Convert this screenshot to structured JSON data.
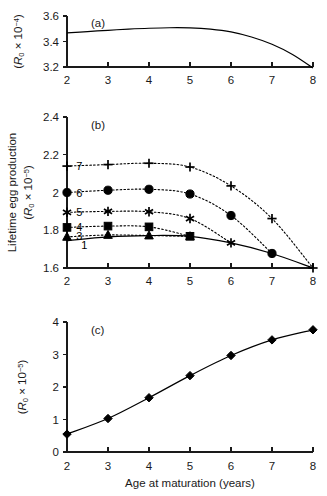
{
  "figure": {
    "xlabel": "Age at maturation (years)",
    "x_ticks": [
      "2",
      "3",
      "4",
      "5",
      "6",
      "7",
      "8"
    ]
  },
  "panels": {
    "a": {
      "tag": "(a)",
      "ylab_prefix": "(",
      "ylab_symbol": "R",
      "ylab_subscript": "0",
      "ylab_mult": " × 10",
      "ylab_exponent": "−4",
      "ylab_suffix": ")",
      "y_ticks": [
        "3.6",
        "3.4",
        "3.2"
      ]
    },
    "b": {
      "tag": "(b)",
      "ylab_title": "Lifetime egg production",
      "ylab_prefix": "(",
      "ylab_symbol": "R",
      "ylab_subscript": "0",
      "ylab_mult": " × 10",
      "ylab_exponent": "−5",
      "ylab_suffix": ")",
      "y_ticks": [
        "2.4",
        "2.2",
        "2",
        "1.8",
        "1.6"
      ],
      "series_labels": [
        "1",
        "3",
        "4",
        "5",
        "6",
        "7"
      ]
    },
    "c": {
      "tag": "(c)",
      "ylab_prefix": "(",
      "ylab_symbol": "R",
      "ylab_subscript": "0",
      "ylab_mult": " × 10",
      "ylab_exponent": "−5",
      "ylab_suffix": ")",
      "y_ticks": [
        "4",
        "3",
        "2",
        "1",
        "0"
      ]
    }
  },
  "chart_data": [
    {
      "type": "line",
      "panel": "a",
      "title": "(a)",
      "xlabel": "Age at maturation (years)",
      "ylabel": "(R0 × 10−4)",
      "xlim": [
        2,
        8
      ],
      "ylim": [
        3.2,
        3.6
      ],
      "xticks": [
        2,
        3,
        4,
        5,
        6,
        7,
        8
      ],
      "yticks": [
        3.2,
        3.4,
        3.6
      ],
      "grid": false,
      "legend": "none",
      "series": [
        {
          "name": "R0 curve",
          "style": "solid",
          "marker": "none",
          "x": [
            2,
            2.5,
            3,
            3.5,
            4,
            4.5,
            5,
            5.5,
            6,
            6.5,
            7,
            7.5,
            8
          ],
          "values": [
            3.468,
            3.478,
            3.488,
            3.497,
            3.504,
            3.508,
            3.507,
            3.497,
            3.475,
            3.435,
            3.378,
            3.298,
            3.192
          ]
        }
      ]
    },
    {
      "type": "line",
      "panel": "b",
      "title": "(b)",
      "xlabel": "Age at maturation (years)",
      "ylabel": "Lifetime egg production (R0 × 10−5)",
      "xlim": [
        2,
        8
      ],
      "ylim": [
        1.6,
        2.4
      ],
      "xticks": [
        2,
        3,
        4,
        5,
        6,
        7,
        8
      ],
      "yticks": [
        1.6,
        1.8,
        2.0,
        2.2,
        2.4
      ],
      "grid": false,
      "legend": "inline-labels",
      "categories": [
        2,
        3,
        4,
        5,
        6,
        7,
        8
      ],
      "series": [
        {
          "name": "1",
          "label": "1",
          "style": "solid",
          "marker": "none",
          "x": [
            2,
            3,
            4,
            5,
            6,
            7,
            8
          ],
          "values": [
            1.745,
            1.765,
            1.772,
            1.768,
            1.733,
            1.677,
            1.6
          ]
        },
        {
          "name": "3",
          "label": "3",
          "style": "dotted",
          "marker": "triangle",
          "x": [
            2,
            3,
            4,
            5
          ],
          "values": [
            1.765,
            1.775,
            1.772,
            1.768
          ]
        },
        {
          "name": "4",
          "label": "4",
          "style": "dotted",
          "marker": "square",
          "x": [
            2,
            3,
            4,
            5
          ],
          "values": [
            1.815,
            1.822,
            1.818,
            1.768
          ]
        },
        {
          "name": "5",
          "label": "5",
          "style": "dotted",
          "marker": "star",
          "x": [
            2,
            3,
            4,
            5,
            6
          ],
          "values": [
            1.895,
            1.9,
            1.898,
            1.862,
            1.733
          ]
        },
        {
          "name": "6",
          "label": "6",
          "style": "dotted",
          "marker": "circle",
          "x": [
            2,
            3,
            4,
            5,
            6,
            7
          ],
          "values": [
            2.0,
            2.012,
            2.017,
            1.992,
            1.878,
            1.677
          ]
        },
        {
          "name": "7",
          "label": "7",
          "style": "dotted",
          "marker": "plus",
          "x": [
            2,
            3,
            4,
            5,
            6,
            7,
            8
          ],
          "values": [
            2.14,
            2.148,
            2.155,
            2.135,
            2.035,
            1.862,
            1.6
          ]
        }
      ]
    },
    {
      "type": "line",
      "panel": "c",
      "title": "(c)",
      "xlabel": "Age at maturation (years)",
      "ylabel": "(R0 × 10−5)",
      "xlim": [
        2,
        8
      ],
      "ylim": [
        0,
        4
      ],
      "xticks": [
        2,
        3,
        4,
        5,
        6,
        7,
        8
      ],
      "yticks": [
        0,
        1,
        2,
        3,
        4
      ],
      "grid": false,
      "legend": "none",
      "series": [
        {
          "name": "R0 total",
          "style": "solid",
          "marker": "diamond",
          "x": [
            2,
            3,
            4,
            5,
            6,
            7,
            8
          ],
          "values": [
            0.55,
            1.03,
            1.67,
            2.35,
            2.97,
            3.45,
            3.76
          ]
        }
      ]
    }
  ]
}
